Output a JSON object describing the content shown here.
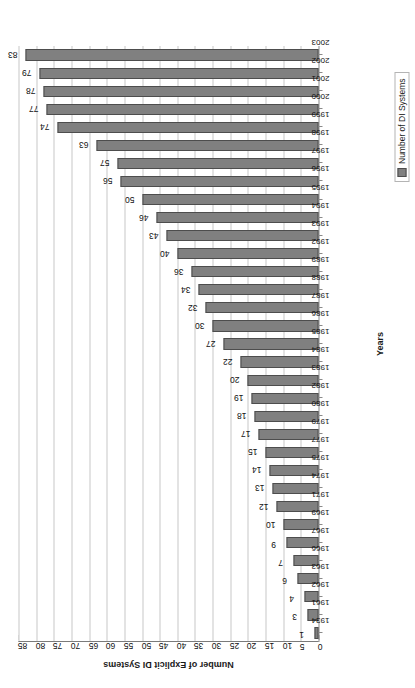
{
  "chart_data": {
    "type": "bar",
    "orientation": "vertical",
    "page_rotation_degrees": -90,
    "title": "",
    "xlabel": "Years",
    "ylabel": "Number of Explicit DI Systems",
    "ylim": [
      0,
      85
    ],
    "ytick_step": 5,
    "yticks": [
      85,
      80,
      75,
      70,
      65,
      60,
      55,
      50,
      45,
      40,
      35,
      30,
      25,
      20,
      15,
      10,
      5,
      0
    ],
    "grid": true,
    "grid_axis": "y",
    "legend_position": "bottom-right",
    "legend": [
      "Number of DI Systems"
    ],
    "series": [
      {
        "name": "Number of DI Systems",
        "color": "#808080",
        "values": [
          1,
          3,
          4,
          6,
          7,
          9,
          10,
          12,
          13,
          14,
          15,
          17,
          18,
          19,
          20,
          22,
          27,
          30,
          32,
          34,
          36,
          40,
          43,
          46,
          50,
          56,
          57,
          63,
          74,
          77,
          78,
          79,
          83
        ]
      }
    ],
    "categories": [
      "1934",
      "1961",
      "1962",
      "1963",
      "1966",
      "1967",
      "1969",
      "1971",
      "1974",
      "1975",
      "1977",
      "1979",
      "1980",
      "1982",
      "1983",
      "1984",
      "1985",
      "1986",
      "1987",
      "1988",
      "1989",
      "1992",
      "1993",
      "1994",
      "1995",
      "1996",
      "1997",
      "1998",
      "1999",
      "2000",
      "2001",
      "2002",
      "2003"
    ],
    "data_labels": [
      "1",
      "3",
      "4",
      "6",
      "7",
      "9",
      "10",
      "12",
      "13",
      "14",
      "15",
      "17",
      "18",
      "19",
      "20",
      "22",
      "27",
      "30",
      "32",
      "34",
      "36",
      "40",
      "43",
      "46",
      "50",
      "56",
      "57",
      "63",
      "74",
      "77",
      "78",
      "79",
      "83"
    ]
  }
}
